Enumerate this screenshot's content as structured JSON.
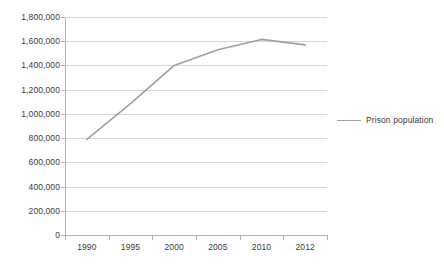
{
  "chart_data": {
    "type": "line",
    "title": "",
    "xlabel": "",
    "ylabel": "",
    "categories": [
      "1990",
      "1995",
      "2000",
      "2005",
      "2010",
      "2012"
    ],
    "series": [
      {
        "name": "Prison population",
        "color": "#a0a0a0",
        "values": [
          790000,
          1085000,
          1400000,
          1530000,
          1615000,
          1570000
        ]
      }
    ],
    "ylim": [
      0,
      1800000
    ],
    "ytick_values": [
      0,
      200000,
      400000,
      600000,
      800000,
      1000000,
      1200000,
      1400000,
      1600000,
      1800000
    ],
    "ytick_labels": [
      "0",
      "200,000",
      "400,000",
      "600,000",
      "800,000",
      "1,000,000",
      "1,200,000",
      "1,400,000",
      "1,600,000",
      "1,800,000"
    ],
    "grid": true,
    "grid_axis": "y",
    "grid_color": "#d6d6d6",
    "axis_color": "#b3b3b3",
    "background": "#ffffff",
    "legend_position": "right",
    "legend_entries": [
      "Prison population"
    ]
  }
}
